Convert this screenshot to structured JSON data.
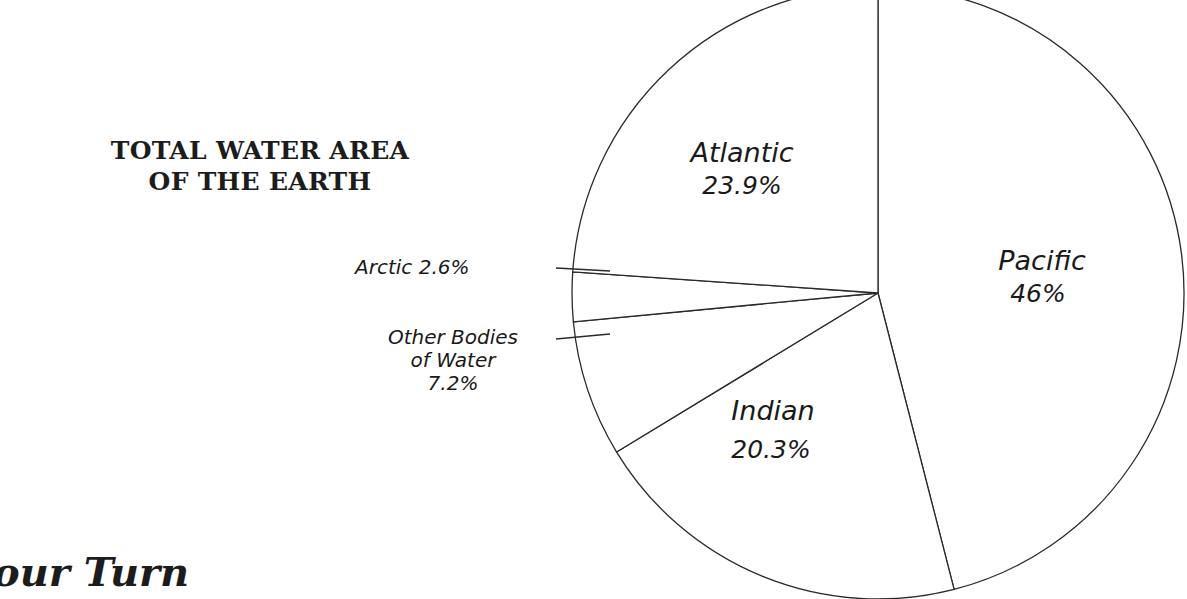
{
  "title": {
    "line1": "TOTAL WATER AREA",
    "line2": "OF THE EARTH"
  },
  "section_heading": "Your Turn",
  "chart_data": {
    "type": "pie",
    "title": "TOTAL WATER AREA OF THE EARTH",
    "unit": "%",
    "slices": [
      {
        "name": "Pacific",
        "value": 46,
        "label": "Pacific",
        "value_label": "46%"
      },
      {
        "name": "Indian",
        "value": 20.3,
        "label": "Indian",
        "value_label": "20.3%"
      },
      {
        "name": "Other Bodies of Water",
        "value": 7.2,
        "label": "Other Bodies of Water",
        "value_label": "7.2%"
      },
      {
        "name": "Arctic",
        "value": 2.6,
        "label": "Arctic",
        "value_label": "2.6%"
      },
      {
        "name": "Atlantic",
        "value": 23.9,
        "label": "Atlantic",
        "value_label": "23.9%"
      }
    ],
    "start_angle_deg": 0,
    "direction": "clockwise",
    "fill_color": "#ffffff",
    "stroke_color": "#2a2a2a",
    "legend": "none",
    "label_style": "handwritten"
  },
  "labels": {
    "atlantic": {
      "name": "Atlantic",
      "value": "23.9%"
    },
    "pacific": {
      "name": "Pacific",
      "value": "46%"
    },
    "indian": {
      "name": "Indian",
      "value": "20.3%"
    },
    "arctic": {
      "text": "Arctic 2.6%"
    },
    "other": {
      "line1": "Other Bodies",
      "line2": "of Water",
      "line3": "7.2%"
    }
  }
}
